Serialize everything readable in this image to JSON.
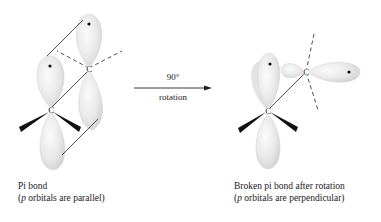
{
  "arrow": {
    "top_label": "90°",
    "bottom_label": "rotation"
  },
  "left_structure": {
    "atoms": [
      "C",
      "C"
    ],
    "caption_line1": "Pi bond",
    "caption_line2_prefix": "(",
    "caption_line2_italic": "p",
    "caption_line2_rest": " orbitals are parallel)"
  },
  "right_structure": {
    "atoms": [
      "C",
      "C"
    ],
    "caption_line1": "Broken pi bond after rotation",
    "caption_line2_prefix": "(",
    "caption_line2_italic": "p",
    "caption_line2_rest": " orbitals are perpendicular)"
  },
  "colors": {
    "lobe_fill": "#e6e6e6",
    "lobe_edge": "#c8c8c8",
    "line": "#222222",
    "wedge": "#111111"
  }
}
